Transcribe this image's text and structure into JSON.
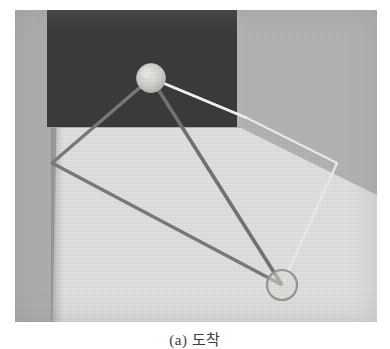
{
  "figure": {
    "caption": "(a) 도착",
    "caption_note": "caption partially cropped at bottom edge of image",
    "panel_label": "(a)"
  },
  "photo": {
    "description": "Scanned halftone photograph of a vision/robotics scene",
    "regions": [
      {
        "name": "dark-backdrop-panel",
        "tone": "dark",
        "color": "#3a3a3a"
      },
      {
        "name": "bright-floor-plane",
        "tone": "light",
        "color": "#e8e8e6"
      },
      {
        "name": "left-gray-column",
        "tone": "mid",
        "color": "#b4b4b4"
      },
      {
        "name": "right-gray-wall",
        "tone": "mid",
        "color": "#b9b9b9"
      }
    ],
    "markers": [
      {
        "name": "sphere-marker",
        "shape": "filled-circle",
        "cx": 136,
        "cy": 68,
        "r": 14,
        "color": "#d8d8d4"
      },
      {
        "name": "ring-marker",
        "shape": "outline-circle",
        "cx": 267,
        "cy": 275,
        "r": 15,
        "color": "#9a9a9a"
      }
    ],
    "shapes": [
      {
        "name": "dark-quadrilateral",
        "stroke": "#7b7b7b",
        "width": 3,
        "points": "136,68 37,153 267,275 136,68"
      },
      {
        "name": "light-quadrilateral",
        "stroke": "#f2f2ee",
        "width": 2,
        "points": "136,68 232,108 322,153 267,275"
      }
    ],
    "colors": {
      "dark_panel": "#3a3a3a",
      "floor": "#e8e8e6",
      "wall_gray": "#b9b9b9",
      "dark_line": "#7b7b7b",
      "light_line": "#f2f2ee",
      "sphere": "#d8d8d4",
      "ring_stroke": "#9a9a9a"
    }
  }
}
